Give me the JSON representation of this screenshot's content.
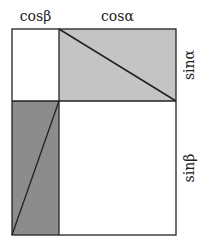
{
  "diagram": {
    "type": "trig-identity-rectangle",
    "labels": {
      "top_left": "cosβ",
      "top_right": "cosα",
      "right_top": "sinα",
      "right_bottom": "sinβ"
    },
    "colors": {
      "light_fill": "#c0c0c0",
      "dark_fill": "#8a8a8a",
      "white_fill": "#ffffff",
      "stroke": "#222222"
    },
    "regions": [
      {
        "name": "top-left",
        "fill": "white"
      },
      {
        "name": "top-right",
        "fill": "light gray",
        "diagonal": "top-left to bottom-right"
      },
      {
        "name": "bottom-left",
        "fill": "dark gray",
        "diagonal": "bottom-left to top-right"
      },
      {
        "name": "bottom-right",
        "fill": "white"
      }
    ]
  }
}
